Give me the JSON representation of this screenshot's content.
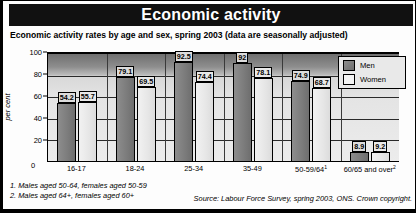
{
  "header": {
    "title": "Economic activity"
  },
  "subtitle": "Economic activity rates by age and sex, spring 2003 (data are seasonally adjusted)",
  "legend": {
    "men_label": "Men",
    "women_label": "Women"
  },
  "axis": {
    "y_label": "per cent",
    "y_ticks": [
      "100",
      "80",
      "60",
      "40",
      "20",
      "0"
    ],
    "zero_label": "0"
  },
  "footnotes": [
    "1. Males aged 50-64, females aged 50-59",
    "2. Males aged 64+, females aged 60+"
  ],
  "source": "Source: Labour Force Survey, spring 2003, ONS. Crown copyright.",
  "colors": {
    "men_bar": "#7b7b7b",
    "women_bar": "#e6e6e6",
    "title_bg": "#111111",
    "title_text": "#ffffff",
    "plot_bg_top": "#6f6f6f",
    "plot_bg_bottom": "#ececec"
  },
  "chart_data": {
    "type": "bar",
    "title": "Economic activity",
    "subtitle": "Economic activity rates by age and sex, spring 2003 (data are seasonally adjusted)",
    "xlabel": "",
    "ylabel": "per cent",
    "ylim": [
      0,
      100
    ],
    "y_ticks": [
      0,
      20,
      40,
      60,
      80,
      100
    ],
    "grid": true,
    "legend_position": "top-right",
    "categories": [
      "16-17",
      "18-24",
      "25-34",
      "35-49",
      "50-59/64",
      "60/65 and over"
    ],
    "category_footnotes": [
      "",
      "",
      "",
      "",
      "1",
      "2"
    ],
    "series": [
      {
        "name": "Men",
        "values": [
          54.2,
          79.1,
          92.5,
          92,
          74.9,
          8.9
        ]
      },
      {
        "name": "Women",
        "values": [
          55.7,
          69.5,
          74.4,
          78.1,
          68.7,
          9.2
        ]
      }
    ],
    "source": "Source: Labour Force Survey, spring 2003, ONS. Crown copyright."
  }
}
